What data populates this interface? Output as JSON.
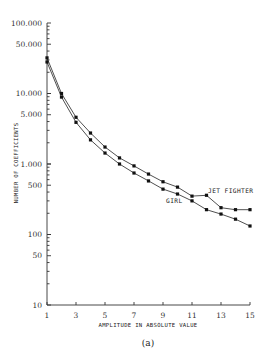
{
  "chart_data": {
    "type": "line",
    "title": "",
    "caption": "(a)",
    "xlabel": "AMPLITUDE IN ABSOLUTE VALUE",
    "ylabel": "NUMBER OF COEFFICIENTS",
    "yscale": "log",
    "xlim": [
      1,
      15
    ],
    "ylim": [
      10,
      100000
    ],
    "grid": false,
    "x_ticks": [
      1,
      3,
      5,
      7,
      9,
      11,
      13,
      15
    ],
    "x_tick_labels": [
      "1",
      "3",
      "5",
      "7",
      "9",
      "11",
      "13",
      "15"
    ],
    "y_ticks": [
      100000,
      50000,
      10000,
      5000,
      1000,
      500,
      100,
      50,
      10
    ],
    "y_tick_labels": [
      "100.000",
      "50.000",
      "10.000",
      "5.000",
      "1.000",
      "500",
      "100",
      "50",
      "10"
    ],
    "x": [
      1,
      2,
      3,
      4,
      5,
      6,
      7,
      8,
      9,
      10,
      11,
      12,
      13,
      14,
      15
    ],
    "series": [
      {
        "name": "JET FIGHTER",
        "values": [
          32000,
          10000,
          4600,
          2750,
          1740,
          1220,
          940,
          720,
          560,
          470,
          350,
          360,
          240,
          225,
          225
        ],
        "label_pos": [
          208,
          191
        ]
      },
      {
        "name": "GIRL",
        "values": [
          28000,
          8900,
          3900,
          2200,
          1430,
          1000,
          745,
          575,
          440,
          375,
          300,
          225,
          195,
          165,
          132
        ],
        "label_pos": [
          166,
          201
        ]
      }
    ]
  }
}
